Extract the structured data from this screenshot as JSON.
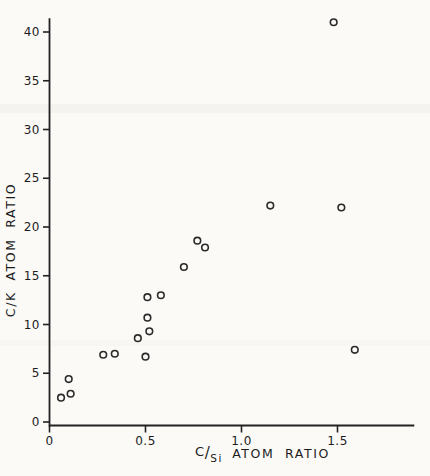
{
  "figure": {
    "background": "#fbfaf7",
    "ink": "#222222",
    "marker_color": "#2a2a2a"
  },
  "chart_data": {
    "type": "scatter",
    "title": "",
    "xlabel": "C/Si ATOM RATIO",
    "xlabel_parts": {
      "numerator": "C",
      "slash": "/",
      "denominator": "Si",
      "rest": "ATOM RATIO"
    },
    "ylabel": "C/K ATOM RATIO",
    "xlim": [
      0,
      1.9
    ],
    "ylim": [
      0,
      41.4
    ],
    "grid": false,
    "legend": null,
    "marker": "open-circle",
    "x_ticks": [
      {
        "value": 0,
        "label": "0"
      },
      {
        "value": 0.5,
        "label": "0.5"
      },
      {
        "value": 1.0,
        "label": "1.0"
      },
      {
        "value": 1.5,
        "label": "1.5"
      }
    ],
    "y_ticks": [
      {
        "value": 0,
        "label": "0"
      },
      {
        "value": 5,
        "label": "5"
      },
      {
        "value": 10,
        "label": "10"
      },
      {
        "value": 15,
        "label": "15"
      },
      {
        "value": 20,
        "label": "20"
      },
      {
        "value": 25,
        "label": "25"
      },
      {
        "value": 30,
        "label": "30"
      },
      {
        "value": 35,
        "label": "35"
      },
      {
        "value": 40,
        "label": "40"
      }
    ],
    "points": [
      {
        "x": 0.06,
        "y": 2.5
      },
      {
        "x": 0.1,
        "y": 4.4
      },
      {
        "x": 0.11,
        "y": 2.9
      },
      {
        "x": 0.28,
        "y": 6.9
      },
      {
        "x": 0.34,
        "y": 7.0
      },
      {
        "x": 0.46,
        "y": 8.6
      },
      {
        "x": 0.5,
        "y": 6.7
      },
      {
        "x": 0.51,
        "y": 10.7
      },
      {
        "x": 0.51,
        "y": 12.8
      },
      {
        "x": 0.52,
        "y": 9.3
      },
      {
        "x": 0.58,
        "y": 13.0
      },
      {
        "x": 0.7,
        "y": 15.9
      },
      {
        "x": 0.77,
        "y": 18.6
      },
      {
        "x": 0.81,
        "y": 17.9
      },
      {
        "x": 1.15,
        "y": 22.2
      },
      {
        "x": 1.48,
        "y": 41.0
      },
      {
        "x": 1.52,
        "y": 22.0
      },
      {
        "x": 1.59,
        "y": 7.4
      }
    ]
  }
}
